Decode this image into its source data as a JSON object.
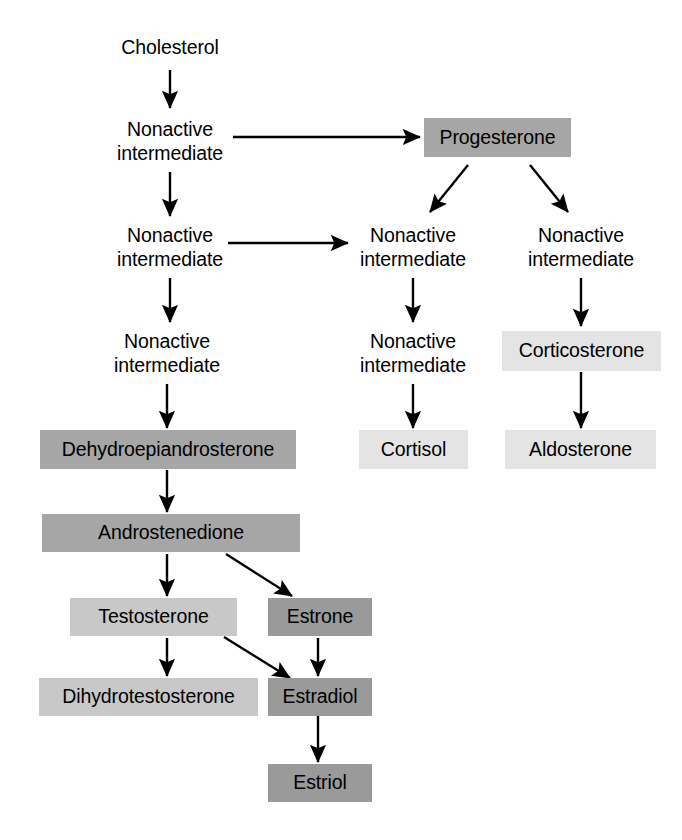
{
  "diagram": {
    "type": "flowchart",
    "background": "#ffffff",
    "arrow_color": "#000000",
    "shades": {
      "mid_gray": "#a6a6a6",
      "light_gray": "#c8c8c8",
      "pale_gray": "#e4e4e4",
      "dark_gray": "#9a9a9a"
    },
    "nodes": [
      {
        "id": "cholesterol",
        "label": "Cholesterol",
        "style": "plain"
      },
      {
        "id": "nonactive-1",
        "label": "Nonactive\nintermediate",
        "style": "plain"
      },
      {
        "id": "nonactive-2",
        "label": "Nonactive\nintermediate",
        "style": "plain"
      },
      {
        "id": "nonactive-3",
        "label": "Nonactive\nintermediate",
        "style": "plain"
      },
      {
        "id": "progesterone",
        "label": "Progesterone",
        "style": "mid_gray"
      },
      {
        "id": "nonactive-mid-1",
        "label": "Nonactive\nintermediate",
        "style": "plain"
      },
      {
        "id": "nonactive-mid-2",
        "label": "Nonactive\nintermediate",
        "style": "plain"
      },
      {
        "id": "nonactive-right-1",
        "label": "Nonactive\nintermediate",
        "style": "plain"
      },
      {
        "id": "corticosterone",
        "label": "Corticosterone",
        "style": "pale_gray"
      },
      {
        "id": "cortisol",
        "label": "Cortisol",
        "style": "pale_gray"
      },
      {
        "id": "aldosterone",
        "label": "Aldosterone",
        "style": "pale_gray"
      },
      {
        "id": "dehydroepiandrosterone",
        "label": "Dehydroepiandrosterone",
        "style": "mid_gray"
      },
      {
        "id": "androstenedione",
        "label": "Androstenedione",
        "style": "mid_gray"
      },
      {
        "id": "testosterone",
        "label": "Testosterone",
        "style": "light_gray"
      },
      {
        "id": "estrone",
        "label": "Estrone",
        "style": "dark_gray"
      },
      {
        "id": "dihydrotestosterone",
        "label": "Dihydrotestosterone",
        "style": "light_gray"
      },
      {
        "id": "estradiol",
        "label": "Estradiol",
        "style": "dark_gray"
      },
      {
        "id": "estriol",
        "label": "Estriol",
        "style": "dark_gray"
      }
    ],
    "edges": [
      {
        "from": "cholesterol",
        "to": "nonactive-1",
        "kind": "vertical"
      },
      {
        "from": "nonactive-1",
        "to": "progesterone",
        "kind": "horizontal"
      },
      {
        "from": "nonactive-1",
        "to": "nonactive-2",
        "kind": "vertical"
      },
      {
        "from": "progesterone",
        "to": "nonactive-mid-1",
        "kind": "diagonal"
      },
      {
        "from": "progesterone",
        "to": "nonactive-right-1",
        "kind": "diagonal"
      },
      {
        "from": "nonactive-2",
        "to": "nonactive-mid-1",
        "kind": "horizontal"
      },
      {
        "from": "nonactive-2",
        "to": "nonactive-3",
        "kind": "vertical"
      },
      {
        "from": "nonactive-mid-1",
        "to": "nonactive-mid-2",
        "kind": "vertical"
      },
      {
        "from": "nonactive-right-1",
        "to": "corticosterone",
        "kind": "vertical"
      },
      {
        "from": "nonactive-mid-2",
        "to": "cortisol",
        "kind": "vertical"
      },
      {
        "from": "corticosterone",
        "to": "aldosterone",
        "kind": "vertical"
      },
      {
        "from": "nonactive-3",
        "to": "dehydroepiandrosterone",
        "kind": "vertical"
      },
      {
        "from": "dehydroepiandrosterone",
        "to": "androstenedione",
        "kind": "vertical"
      },
      {
        "from": "androstenedione",
        "to": "testosterone",
        "kind": "vertical"
      },
      {
        "from": "androstenedione",
        "to": "estrone",
        "kind": "diagonal"
      },
      {
        "from": "testosterone",
        "to": "dihydrotestosterone",
        "kind": "vertical"
      },
      {
        "from": "testosterone",
        "to": "estradiol",
        "kind": "diagonal"
      },
      {
        "from": "estrone",
        "to": "estradiol",
        "kind": "vertical"
      },
      {
        "from": "estradiol",
        "to": "estriol",
        "kind": "vertical"
      }
    ]
  }
}
